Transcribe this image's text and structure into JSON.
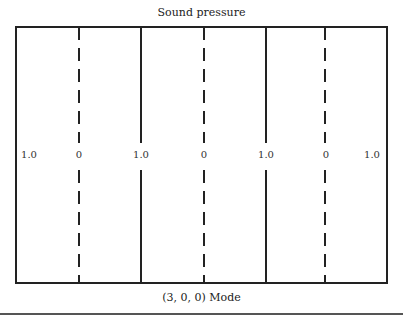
{
  "diagram": {
    "title": "Sound pressure",
    "caption": "(3, 0, 0) Mode",
    "box": {
      "left": 16,
      "top": 27,
      "right": 387,
      "bottom": 283
    },
    "lines": [
      {
        "x": 79,
        "style": "dashed",
        "label": "0"
      },
      {
        "x": 141,
        "style": "solid",
        "label": "1.0"
      },
      {
        "x": 204,
        "style": "dashed",
        "label": "0"
      },
      {
        "x": 266,
        "style": "solid",
        "label": "1.0"
      },
      {
        "x": 325,
        "style": "dashed",
        "label": "0"
      }
    ],
    "labels": [
      {
        "x": 29,
        "text": "1.0"
      },
      {
        "x": 79,
        "text": "0"
      },
      {
        "x": 141,
        "text": "1.0"
      },
      {
        "x": 204,
        "text": "0"
      },
      {
        "x": 266,
        "text": "1.0"
      },
      {
        "x": 326,
        "text": "0"
      },
      {
        "x": 372,
        "text": "1.0"
      }
    ]
  }
}
